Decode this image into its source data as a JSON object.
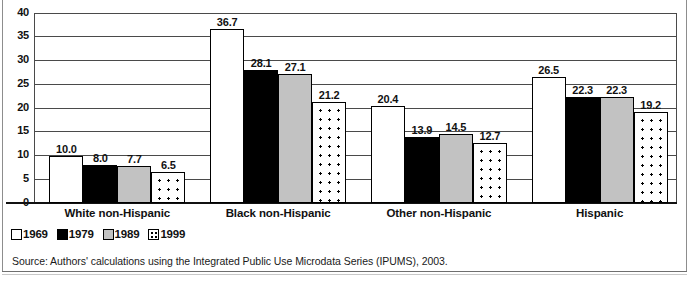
{
  "chart_data": {
    "type": "bar",
    "title": "",
    "subtitle": "",
    "xlabel": "",
    "ylabel": "",
    "ylim": [
      0,
      40
    ],
    "ytick_step": 5,
    "yticks": [
      "0",
      "5",
      "10",
      "15",
      "20",
      "25",
      "30",
      "35",
      "40"
    ],
    "grid": true,
    "legend_position": "bottom-left",
    "categories": [
      "White non-Hispanic",
      "Black non-Hispanic",
      "Other non-Hispanic",
      "Hispanic"
    ],
    "series": [
      {
        "name": "1969",
        "fill": "white",
        "values": [
          10.0,
          36.7,
          20.4,
          26.5
        ],
        "labels": [
          "10.0",
          "36.7",
          "20.4",
          "26.5"
        ]
      },
      {
        "name": "1979",
        "fill": "black",
        "values": [
          8.0,
          28.1,
          13.9,
          22.3
        ],
        "labels": [
          "8.0",
          "28.1",
          "13.9",
          "22.3"
        ]
      },
      {
        "name": "1989",
        "fill": "gray",
        "values": [
          7.7,
          27.1,
          14.5,
          22.3
        ],
        "labels": [
          "7.7",
          "27.1",
          "14.5",
          "22.3"
        ]
      },
      {
        "name": "1999",
        "fill": "dotted",
        "values": [
          6.5,
          21.2,
          12.7,
          19.2
        ],
        "labels": [
          "6.5",
          "21.2",
          "12.7",
          "19.2"
        ]
      }
    ],
    "colors": {
      "series_1969": "#ffffff",
      "series_1979": "#000000",
      "series_1989": "#c2c2c2",
      "series_1999": "#ffffff",
      "outline": "#000000",
      "gridline": "#4a4a4a",
      "text": "#111111",
      "background": "#ffffff"
    },
    "annotations": []
  },
  "legend": {
    "items": [
      {
        "label": "1969"
      },
      {
        "label": "1979"
      },
      {
        "label": "1989"
      },
      {
        "label": "1999"
      }
    ]
  },
  "source": {
    "text": "Source: Authors' calculations using the Integrated Public Use Microdata Series (IPUMS), 2003."
  }
}
